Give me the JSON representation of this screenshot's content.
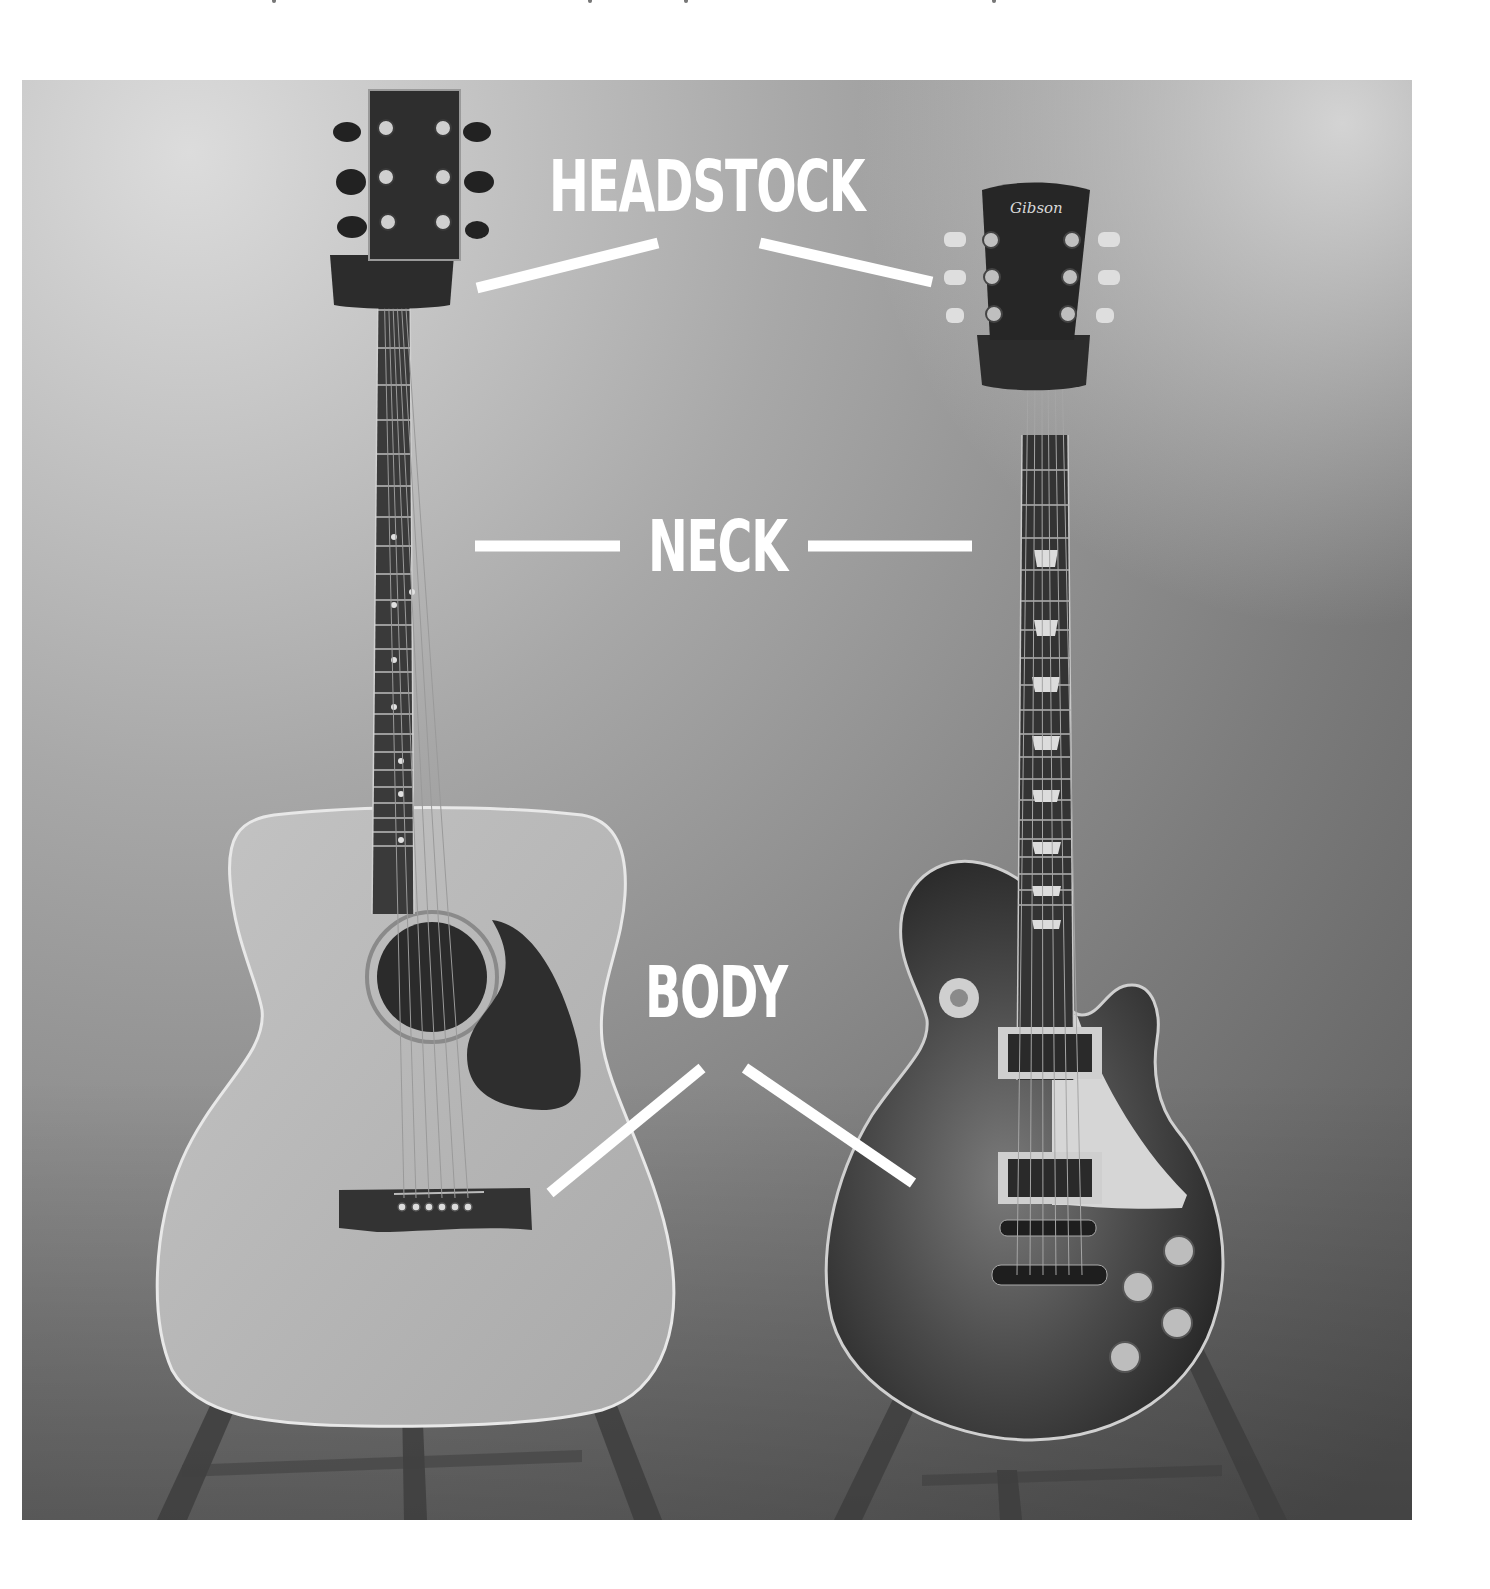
{
  "image": {
    "description": "Acoustic dreadnought guitar and Gibson Les Paul electric guitar on stands with part labels",
    "frame": {
      "x": 22,
      "y": 80,
      "width": 1390,
      "height": 1440
    },
    "colors": {
      "label": "#ffffff",
      "background_light": "#d6d6d6",
      "background_dark": "#5e5e5e",
      "acoustic_top": "#b9b9b9",
      "electric_body": "#3a3a3a",
      "pickguard_electric": "#d9d9d9",
      "pickguard_acoustic": "#2f2f2f"
    }
  },
  "labels": {
    "headstock": "HEADSTOCK",
    "neck": "NECK",
    "body": "BODY"
  },
  "guitars": {
    "left": {
      "type": "acoustic"
    },
    "right": {
      "type": "electric",
      "headstock_logo": "Gibson"
    }
  }
}
